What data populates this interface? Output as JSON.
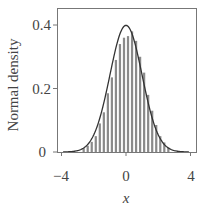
{
  "chart_data": {
    "type": "bar",
    "title": "",
    "xlabel": "x",
    "ylabel": "Normal density",
    "xlim": [
      -4.3,
      4.3
    ],
    "ylim": [
      0,
      0.453
    ],
    "xticks": [
      -4,
      0,
      4
    ],
    "xtick_labels": [
      "−4",
      "0",
      "4"
    ],
    "yticks": [
      0,
      0.2,
      0.4
    ],
    "ytick_labels": [
      "0",
      "0.2",
      "0.4"
    ],
    "grid": false,
    "legend": null,
    "bin_width": 0.25,
    "series": [
      {
        "name": "histogram",
        "kind": "bar",
        "color": "#8a8a8a",
        "bin_starts": [
          -2.75,
          -2.5,
          -2.25,
          -2.0,
          -1.75,
          -1.5,
          -1.25,
          -1.0,
          -0.75,
          -0.5,
          -0.25,
          0.0,
          0.25,
          0.5,
          0.75,
          1.0,
          1.25,
          1.5,
          1.75,
          2.0,
          2.25,
          2.5
        ],
        "values": [
          0.012,
          0.02,
          0.032,
          0.05,
          0.09,
          0.125,
          0.185,
          0.235,
          0.29,
          0.34,
          0.36,
          0.365,
          0.38,
          0.35,
          0.3,
          0.25,
          0.18,
          0.13,
          0.085,
          0.05,
          0.03,
          0.015
        ]
      },
      {
        "name": "normal density curve",
        "kind": "line",
        "color": "#333333",
        "function": "N(0,1) pdf",
        "x_range": [
          -3.9,
          3.9
        ]
      }
    ]
  },
  "labels": {
    "ylabel": "Normal density",
    "xlabel": "x",
    "ytick_0": "0",
    "ytick_1": "0.2",
    "ytick_2": "0.4",
    "xtick_0": "−4",
    "xtick_1": "0",
    "xtick_2": "4"
  }
}
